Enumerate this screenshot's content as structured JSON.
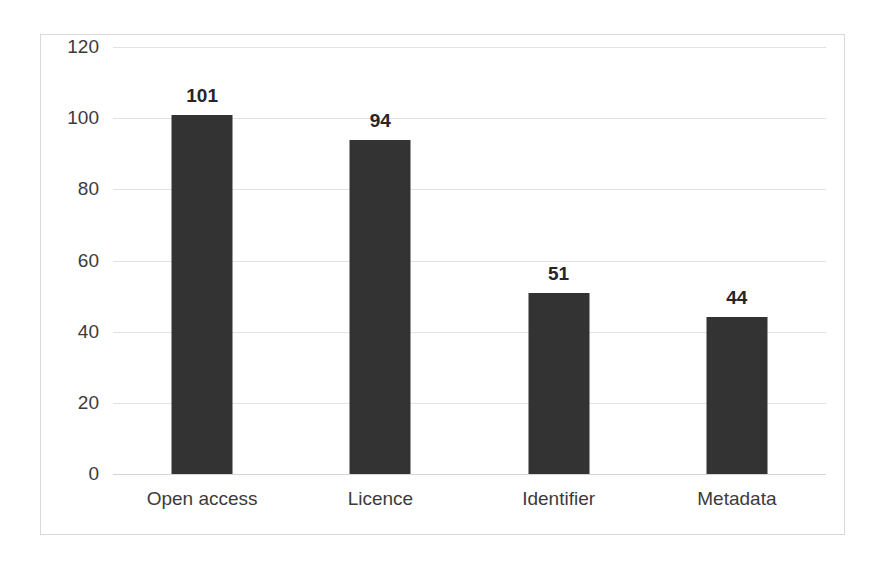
{
  "chart_data": {
    "type": "bar",
    "title": "",
    "subtitle": "",
    "xlabel": "",
    "ylabel": "",
    "categories": [
      "Open access",
      "Licence",
      "Identifier",
      "Metadata"
    ],
    "values": [
      101,
      94,
      51,
      44
    ],
    "data_labels": [
      "101",
      "94",
      "51",
      "44"
    ],
    "series": [
      {
        "name": "",
        "values": [
          101,
          94,
          51,
          44
        ]
      }
    ],
    "ylim": [
      0,
      120
    ],
    "ytick_values": [
      0,
      20,
      40,
      60,
      80,
      100,
      120
    ],
    "ytick_labels": [
      "0",
      "20",
      "40",
      "60",
      "80",
      "100",
      "120"
    ],
    "grid": true,
    "grid_axis": "y",
    "legend": false,
    "legend_position": "none",
    "bar_color": "#333333",
    "gridline_color": "#e2e2e2",
    "frame_color": "#d9d9d9",
    "background_color": "#ffffff",
    "label_color": "#3b3b3b"
  }
}
